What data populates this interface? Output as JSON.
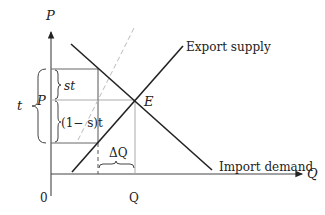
{
  "diagram": {
    "axes": {
      "y_label": "P",
      "x_label": "Q",
      "origin_label": "0"
    },
    "curves": {
      "supply_label": "Export supply",
      "demand_label": "Import demand"
    },
    "points": {
      "equilibrium_label": "E"
    },
    "annotations": {
      "tariff_label": "t",
      "price_label": "P",
      "st_label": "st",
      "one_minus_s_t_label": "(1− s)t",
      "delta_q_label": "ΔQ",
      "q_tick_label": "Q"
    },
    "colors": {
      "line": "#222222",
      "guide": "#9a9a9a",
      "dashed_shifted_supply": "#b8b8b8"
    }
  }
}
